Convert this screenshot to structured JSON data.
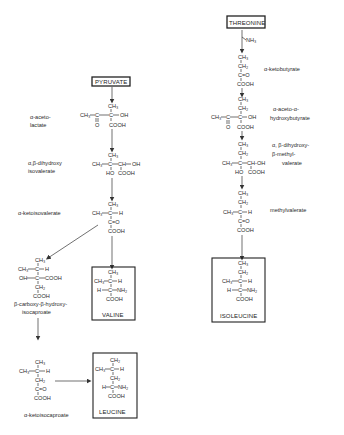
{
  "diagram": {
    "type": "biochemical-pathway",
    "start_nodes": {
      "pyruvate": "PYRUVATE",
      "threonine": "THREONINE"
    },
    "end_products": {
      "valine": "VALINE",
      "isoleucine": "ISOLEUCINE",
      "leucine": "LEUCINE"
    },
    "labels": {
      "acetolactate_1": "α-aceto-",
      "acetolactate_2": "lactate",
      "dihydroxy_isoval_1": "α,β-dihydroxy",
      "dihydroxy_isoval_2": "isovalerate",
      "ketoisovalerate": "α-ketoisovalerate",
      "carboxy_1": "β-carboxy-β-hydroxy-",
      "carboxy_2": "isocaproate",
      "ketoisocaproate": "α-ketoisocaproate",
      "ketobutyrate": "α-ketobutyrate",
      "acetohydroxybutyrate_1": "α-aceto-α-",
      "acetohydroxybutyrate_2": "hydroxybutyrate",
      "dihydroxy_methylval_1": "α, β-dihydroxy-",
      "dihydroxy_methylval_2": "β-methyl-",
      "dihydroxy_methylval_3": "valerate",
      "ketomethylval_1": "α-keto-β-",
      "ketomethylval_2": "methylvalerate",
      "nh3": "NH₃"
    },
    "groups": {
      "ch3": "CH₃",
      "ch2": "CH₂",
      "c": "C",
      "ch": "CH",
      "h": "H",
      "oh": "OH",
      "o": "O",
      "cooh": "COOH",
      "nh2": "NH₂",
      "ch_oh": "CH-OH",
      "ho": "HO",
      "ch3c": "CH₃—C",
      "ch3_dash": "CH₃—",
      "h_dash": "H—",
      "oh_dash": "OH—",
      "dash_h": "—H",
      "dash_oh": "—OH",
      "dash_nh2": "—NH₂",
      "dash_cooh": "—COOH",
      "eq_o": "=O"
    }
  }
}
